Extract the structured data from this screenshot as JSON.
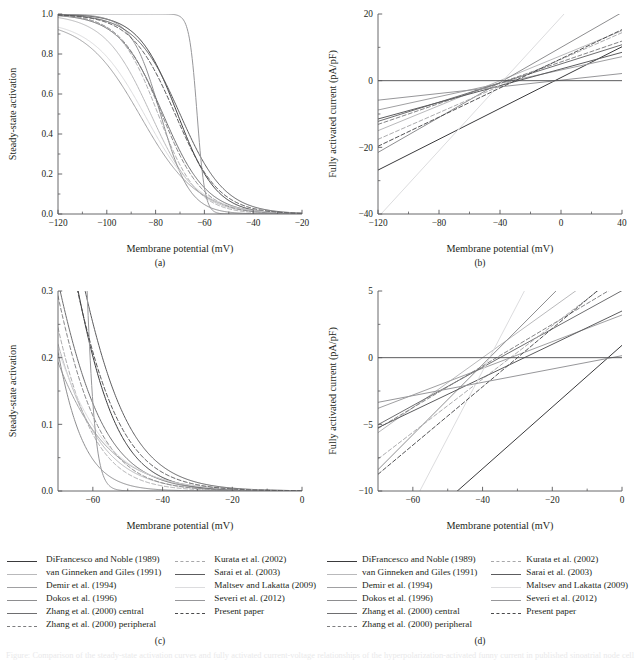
{
  "figure": {
    "panels": [
      {
        "id": "a",
        "label": "(a)",
        "xlabel": "Membrane potential (mV)",
        "ylabel": "Steady-state activation"
      },
      {
        "id": "b",
        "label": "(b)",
        "xlabel": "Membrane potential (mV)",
        "ylabel": "Fully activated current (pA/pF)"
      },
      {
        "id": "c",
        "label": "(c)",
        "xlabel": "Membrane potential (mV)",
        "ylabel": "Steady-state activation"
      },
      {
        "id": "d",
        "label": "(d)",
        "xlabel": "Membrane potential (mV)",
        "ylabel": "Fully activated current (pA/pF)"
      }
    ],
    "legend": {
      "column_left": [
        {
          "label": "DiFrancesco and Noble (1989)",
          "style": "solid",
          "color": "#3a3a3c"
        },
        {
          "label": "van Ginneken and Giles (1991)",
          "style": "solid",
          "color": "#b9b9bb"
        },
        {
          "label": "Demir et al. (1994)",
          "style": "solid",
          "color": "#a0a0a2"
        },
        {
          "label": "Dokos et al. (1996)",
          "style": "solid",
          "color": "#8e8e90"
        },
        {
          "label": "Zhang et al. (2000) central",
          "style": "solid",
          "color": "#6e6e70"
        },
        {
          "label": "Zhang et al. (2000) peripheral",
          "style": "dashed",
          "color": "#7d7d7f"
        }
      ],
      "column_right": [
        {
          "label": "Kurata et al. (2002)",
          "style": "dashed",
          "color": "#a8a8aa"
        },
        {
          "label": "Sarai et al. (2003)",
          "style": "solid",
          "color": "#5c5c5e"
        },
        {
          "label": "Maltsev and Lakatta (2009)",
          "style": "solid",
          "color": "#dcdcde"
        },
        {
          "label": "Severi et al. (2012)",
          "style": "solid",
          "color": "#97979a"
        },
        {
          "label": "Present paper",
          "style": "dashed",
          "color": "#4a4a4c"
        }
      ]
    },
    "caption": "Figure: Comparison of the steady-state activation curves and fully activated current-voltage relationships of the hyperpolarization-activated funny current in published sinoatrial node cell models."
  },
  "chart_data": [
    {
      "id": "a",
      "type": "line",
      "title": "",
      "xlabel": "Membrane potential (mV)",
      "ylabel": "Steady-state activation",
      "xlim": [
        -120,
        -20
      ],
      "ylim": [
        0.0,
        1.0
      ],
      "xticks": [
        -120,
        -100,
        -80,
        -60,
        -40,
        -20
      ],
      "xticklabels": [
        "−120",
        "−100",
        "−80",
        "−60",
        "−40",
        "−20"
      ],
      "yticks": [
        0.0,
        0.2,
        0.4,
        0.6,
        0.8,
        1.0
      ],
      "yticklabels": [
        "0.0",
        "0.2",
        "0.4",
        "0.6",
        "0.8",
        "1.0"
      ],
      "grid": false,
      "legend_position": "below-figure",
      "note": "Boltzmann steady-state activation y_inf = 1/(1+exp((V-V_half)/k)) for each model",
      "series": [
        {
          "name": "DiFrancesco and Noble (1989)",
          "style": "solid",
          "color": "#3a3a3c",
          "v_half": -71.0,
          "slope_k": 8.0,
          "ymax": 1.0
        },
        {
          "name": "van Ginneken and Giles (1991)",
          "style": "solid",
          "color": "#b9b9bb",
          "v_half": -82.0,
          "slope_k": 9.5,
          "ymax": 1.0
        },
        {
          "name": "Demir et al. (1994)",
          "style": "solid",
          "color": "#a0a0a2",
          "v_half": -86.0,
          "slope_k": 11.5,
          "ymax": 0.97
        },
        {
          "name": "Dokos et al. (1996)",
          "style": "solid",
          "color": "#8e8e90",
          "v_half": -78.0,
          "slope_k": 6.0,
          "ymax": 1.0
        },
        {
          "name": "Zhang et al. (2000) central",
          "style": "solid",
          "color": "#6e6e70",
          "v_half": -77.0,
          "slope_k": 9.0,
          "ymax": 1.0
        },
        {
          "name": "Zhang et al. (2000) peripheral",
          "style": "dashed",
          "color": "#7d7d7f",
          "v_half": -77.5,
          "slope_k": 8.5,
          "ymax": 1.0
        },
        {
          "name": "Kurata et al. (2002)",
          "style": "dashed",
          "color": "#a8a8aa",
          "v_half": -79.0,
          "slope_k": 8.0,
          "ymax": 1.0
        },
        {
          "name": "Sarai et al. (2003)",
          "style": "solid",
          "color": "#5c5c5e",
          "v_half": -70.0,
          "slope_k": 9.2,
          "ymax": 1.0
        },
        {
          "name": "Maltsev and Lakatta (2009)",
          "style": "solid",
          "color": "#dcdcde",
          "v_half": -84.0,
          "slope_k": 11.0,
          "ymax": 0.97
        },
        {
          "name": "Severi et al. (2012)",
          "style": "solid",
          "color": "#97979a",
          "v_half": -63.0,
          "slope_k": 1.6,
          "ymax": 1.0
        },
        {
          "name": "Present paper",
          "style": "dashed",
          "color": "#4a4a4c",
          "v_half": -72.0,
          "slope_k": 9.0,
          "ymax": 1.0
        }
      ]
    },
    {
      "id": "b",
      "type": "line",
      "title": "",
      "xlabel": "Membrane potential (mV)",
      "ylabel": "Fully activated current (pA/pF)",
      "xlim": [
        -120,
        40
      ],
      "ylim": [
        -40,
        20
      ],
      "xticks": [
        -120,
        -80,
        -40,
        0,
        40
      ],
      "xticklabels": [
        "−120",
        "−80",
        "−40",
        "0",
        "40"
      ],
      "yticks": [
        -40,
        -20,
        0,
        20
      ],
      "yticklabels": [
        "−40",
        "−20",
        "0",
        "20"
      ],
      "grid": false,
      "legend_position": "below-figure",
      "note": "Linear fully activated I-V relations: I = g*(V - E_rev)",
      "series": [
        {
          "name": "DiFrancesco and Noble (1989)",
          "style": "solid",
          "color": "#3a3a3c",
          "slope": 0.2313,
          "e_rev": -4.0
        },
        {
          "name": "van Ginneken and Giles (1991)",
          "style": "solid",
          "color": "#b9b9bb",
          "slope": 0.1875,
          "e_rev": -40.0
        },
        {
          "name": "Demir et al. (1994)",
          "style": "solid",
          "color": "#a0a0a2",
          "slope": 0.1,
          "e_rev": -32.0
        },
        {
          "name": "Dokos et al. (1996)",
          "style": "solid",
          "color": "#8e8e90",
          "slope": 0.2625,
          "e_rev": -38.0
        },
        {
          "name": "Zhang et al. (2000) central",
          "style": "solid",
          "color": "#6e6e70",
          "slope": 0.1437,
          "e_rev": -35.0
        },
        {
          "name": "Zhang et al. (2000) peripheral",
          "style": "dashed",
          "color": "#7d7d7f",
          "slope": 0.1562,
          "e_rev": -36.0
        },
        {
          "name": "Kurata et al. (2002)",
          "style": "dashed",
          "color": "#a8a8aa",
          "slope": 0.2,
          "e_rev": -32.0
        },
        {
          "name": "Sarai et al. (2003)",
          "style": "solid",
          "color": "#5c5c5e",
          "slope": 0.125,
          "e_rev": -28.0
        },
        {
          "name": "Maltsev and Lakatta (2009)",
          "style": "solid",
          "color": "#dcdcde",
          "slope": 0.5,
          "e_rev": -38.0
        },
        {
          "name": "Severi et al. (2012)",
          "style": "solid",
          "color": "#97979a",
          "slope": 0.05,
          "e_rev": -3.0
        },
        {
          "name": "Present paper",
          "style": "dashed",
          "color": "#4a4a4c",
          "slope": 0.2187,
          "e_rev": -30.0
        }
      ]
    },
    {
      "id": "c",
      "type": "line",
      "title": "",
      "xlabel": "Membrane potential (mV)",
      "ylabel": "Steady-state activation",
      "xlim": [
        -70,
        0
      ],
      "ylim": [
        0.0,
        0.3
      ],
      "xticks": [
        -60,
        -40,
        -20,
        0
      ],
      "xticklabels": [
        "−60",
        "−40",
        "−20",
        "0"
      ],
      "yticks": [
        0.0,
        0.1,
        0.2,
        0.3
      ],
      "yticklabels": [
        "0.0",
        "0.1",
        "0.2",
        "0.3"
      ],
      "grid": false,
      "legend_position": "below-panel",
      "note": "Magnified view of panel (a) steady-state activation near threshold",
      "series": [
        {
          "name": "DiFrancesco and Noble (1989)",
          "style": "solid",
          "color": "#3a3a3c",
          "v_half": -71.0,
          "slope_k": 8.0,
          "ymax": 1.0
        },
        {
          "name": "van Ginneken and Giles (1991)",
          "style": "solid",
          "color": "#b9b9bb",
          "v_half": -82.0,
          "slope_k": 9.5,
          "ymax": 1.0
        },
        {
          "name": "Demir et al. (1994)",
          "style": "solid",
          "color": "#a0a0a2",
          "v_half": -86.0,
          "slope_k": 11.5,
          "ymax": 0.97
        },
        {
          "name": "Dokos et al. (1996)",
          "style": "solid",
          "color": "#8e8e90",
          "v_half": -78.0,
          "slope_k": 6.0,
          "ymax": 1.0
        },
        {
          "name": "Zhang et al. (2000) central",
          "style": "solid",
          "color": "#6e6e70",
          "v_half": -77.0,
          "slope_k": 9.0,
          "ymax": 1.0
        },
        {
          "name": "Zhang et al. (2000) peripheral",
          "style": "dashed",
          "color": "#7d7d7f",
          "v_half": -77.5,
          "slope_k": 8.5,
          "ymax": 1.0
        },
        {
          "name": "Kurata et al. (2002)",
          "style": "dashed",
          "color": "#a8a8aa",
          "v_half": -79.0,
          "slope_k": 8.0,
          "ymax": 1.0
        },
        {
          "name": "Sarai et al. (2003)",
          "style": "solid",
          "color": "#5c5c5e",
          "v_half": -70.0,
          "slope_k": 9.2,
          "ymax": 1.0
        },
        {
          "name": "Maltsev and Lakatta (2009)",
          "style": "solid",
          "color": "#dcdcde",
          "v_half": -84.0,
          "slope_k": 11.0,
          "ymax": 0.97
        },
        {
          "name": "Severi et al. (2012)",
          "style": "solid",
          "color": "#97979a",
          "v_half": -63.0,
          "slope_k": 1.6,
          "ymax": 1.0
        },
        {
          "name": "Present paper",
          "style": "dashed",
          "color": "#4a4a4c",
          "v_half": -72.0,
          "slope_k": 9.0,
          "ymax": 1.0
        }
      ]
    },
    {
      "id": "d",
      "type": "line",
      "title": "",
      "xlabel": "Membrane potential (mV)",
      "ylabel": "Fully activated current (pA/pF)",
      "xlim": [
        -70,
        0
      ],
      "ylim": [
        -10,
        5
      ],
      "xticks": [
        -60,
        -40,
        -20,
        0
      ],
      "xticklabels": [
        "−60",
        "−40",
        "−20",
        "0"
      ],
      "yticks": [
        -10,
        -5,
        0,
        5
      ],
      "yticklabels": [
        "−10",
        "−5",
        "0",
        "5"
      ],
      "grid": false,
      "legend_position": "below-panel",
      "note": "Magnified view of panel (b) fully activated I-V relations",
      "series": [
        {
          "name": "DiFrancesco and Noble (1989)",
          "style": "solid",
          "color": "#3a3a3c",
          "slope": 0.2313,
          "e_rev": -4.0
        },
        {
          "name": "van Ginneken and Giles (1991)",
          "style": "solid",
          "color": "#b9b9bb",
          "slope": 0.1875,
          "e_rev": -40.0
        },
        {
          "name": "Demir et al. (1994)",
          "style": "solid",
          "color": "#a0a0a2",
          "slope": 0.1,
          "e_rev": -32.0
        },
        {
          "name": "Dokos et al. (1996)",
          "style": "solid",
          "color": "#8e8e90",
          "slope": 0.2625,
          "e_rev": -38.0
        },
        {
          "name": "Zhang et al. (2000) central",
          "style": "solid",
          "color": "#6e6e70",
          "slope": 0.1437,
          "e_rev": -35.0
        },
        {
          "name": "Zhang et al. (2000) peripheral",
          "style": "dashed",
          "color": "#7d7d7f",
          "slope": 0.1562,
          "e_rev": -36.0
        },
        {
          "name": "Kurata et al. (2002)",
          "style": "dashed",
          "color": "#a8a8aa",
          "slope": 0.2,
          "e_rev": -32.0
        },
        {
          "name": "Sarai et al. (2003)",
          "style": "solid",
          "color": "#5c5c5e",
          "slope": 0.125,
          "e_rev": -28.0
        },
        {
          "name": "Maltsev and Lakatta (2009)",
          "style": "solid",
          "color": "#dcdcde",
          "slope": 0.5,
          "e_rev": -38.0
        },
        {
          "name": "Severi et al. (2012)",
          "style": "solid",
          "color": "#97979a",
          "slope": 0.05,
          "e_rev": -3.0
        },
        {
          "name": "Present paper",
          "style": "dashed",
          "color": "#4a4a4c",
          "slope": 0.2187,
          "e_rev": -30.0
        }
      ]
    }
  ]
}
